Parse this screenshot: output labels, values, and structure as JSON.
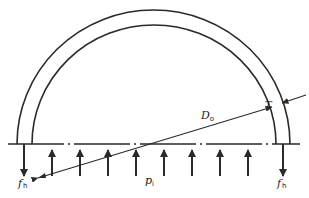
{
  "diagram": {
    "colors": {
      "stroke": "#2a2a2a",
      "background": "#ffffff"
    },
    "labels": {
      "diameter": {
        "main": "D",
        "sub": "o"
      },
      "thickness": {
        "main": "T"
      },
      "pressure": {
        "main": "p",
        "sub": "i"
      },
      "hoop_force_left": {
        "main": "f",
        "sub": "h"
      },
      "hoop_force_right": {
        "main": "f",
        "sub": "h"
      }
    },
    "pressure_arrows_x": [
      52,
      80,
      108,
      164,
      192,
      220,
      248
    ],
    "hoop_arrows_x": [
      24,
      283
    ]
  }
}
